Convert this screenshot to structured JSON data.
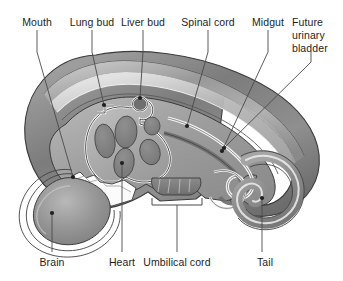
{
  "figure": {
    "background_color": "#ffffff",
    "text_color": "#1d1d1d",
    "leader_line_color": "#4a4a4a",
    "outline_color": "#3b3b3b"
  },
  "labels": {
    "mouth": "Mouth",
    "lung_bud": "Lung bud",
    "liver_bud": "Liver bud",
    "spinal_cord": "Spinal cord",
    "midgut": "Midgut",
    "future_urinary_bladder_line1": "Future",
    "future_urinary_bladder_line2": "urinary",
    "future_urinary_bladder_line3": "bladder",
    "brain": "Brain",
    "heart": "Heart",
    "umbilical_cord": "Umbilical cord",
    "tail": "Tail"
  },
  "callouts": [
    {
      "name": "mouth",
      "text": "Mouth",
      "label_x": 37,
      "label_y": 16,
      "anchor": "center",
      "target_x": 73,
      "target_y": 177,
      "dot": true
    },
    {
      "name": "lung-bud",
      "text": "Lung bud",
      "label_x": 92,
      "label_y": 16,
      "anchor": "center",
      "target_x": 104,
      "target_y": 105,
      "dot": true
    },
    {
      "name": "liver-bud",
      "text": "Liver bud",
      "label_x": 143,
      "label_y": 16,
      "anchor": "center",
      "target_x": 140,
      "target_y": 98,
      "dot": true
    },
    {
      "name": "spinal-cord",
      "text": "Spinal cord",
      "label_x": 208,
      "label_y": 16,
      "anchor": "center",
      "target_x": 187,
      "target_y": 126,
      "dot": true
    },
    {
      "name": "midgut",
      "text": "Midgut",
      "label_x": 268,
      "label_y": 16,
      "anchor": "center",
      "target_x": 222,
      "target_y": 151,
      "dot": true
    },
    {
      "name": "future-urinary-bladder",
      "text": "Future urinary bladder",
      "label_x": 292,
      "label_y": 16,
      "anchor": "left",
      "target_x": 224,
      "target_y": 148,
      "dot": true
    },
    {
      "name": "brain",
      "text": "Brain",
      "label_x": 52,
      "label_y": 258,
      "anchor": "center",
      "target_x": 52,
      "target_y": 213,
      "dot": true
    },
    {
      "name": "heart",
      "text": "Heart",
      "label_x": 122,
      "label_y": 258,
      "anchor": "center",
      "target_x": 122,
      "target_y": 163,
      "dot": true
    },
    {
      "name": "umbilical-cord",
      "text": "Umbilical cord",
      "label_x": 177,
      "label_y": 258,
      "anchor": "center",
      "target_x": 177,
      "target_y": 192,
      "dot": false
    },
    {
      "name": "tail",
      "text": "Tail",
      "label_x": 265,
      "label_y": 258,
      "anchor": "center",
      "target_x": 262,
      "target_y": 198,
      "dot": true
    }
  ],
  "structures": {
    "body_wall": "outer body wall",
    "amnion_layers": "nested membrane layers",
    "heart_chambers": "heart chamber lobes",
    "brain_vesicle": "brain vesicle",
    "gut_tube": "gut tube",
    "tail_curl": "tail curl",
    "umbilical_bracket": "umbilical cord bracket"
  },
  "palette": {
    "outer_dark": "#6e6e6e",
    "outer_mid": "#8d8d8d",
    "outer_light": "#a8a8a8",
    "body_fill": "#9b9b9b",
    "cavity_fill": "#b0b0b0",
    "organ_dark": "#7d7d7d",
    "highlight": "#f2f2f2",
    "white": "#ffffff",
    "stroke": "#3b3b3b"
  }
}
